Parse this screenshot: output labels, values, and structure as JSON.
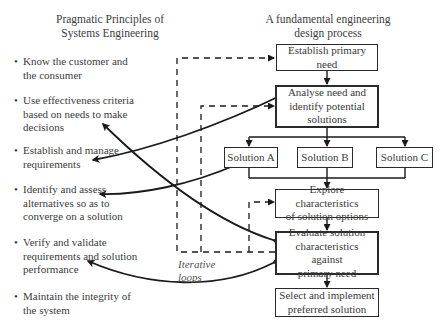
{
  "left_column": {
    "heading_line1": "Pragmatic Principles of",
    "heading_line2": "Systems Engineering",
    "principles": [
      {
        "line1": "Know the customer and",
        "line2": "the consumer",
        "line3": ""
      },
      {
        "line1": "Use effectiveness criteria",
        "line2": "based on needs to make",
        "line3": "decisions"
      },
      {
        "line1": "Establish and manage",
        "line2": "requirements",
        "line3": ""
      },
      {
        "line1": "Identify and assess",
        "line2": "alternatives so as to",
        "line3": "converge on a solution"
      },
      {
        "line1": "Verify and validate",
        "line2": "requirements and solution",
        "line3": "performance"
      },
      {
        "line1": "Maintain the integrity of",
        "line2": "the system",
        "line3": ""
      }
    ]
  },
  "right_column": {
    "heading_line1": "A fundamental engineering",
    "heading_line2": "design process",
    "steps": [
      {
        "id": "establish",
        "line1": "Establish primary",
        "line2": "need",
        "line3": ""
      },
      {
        "id": "analyse",
        "line1": "Analyse need and",
        "line2": "identify potential",
        "line3": "solutions"
      },
      {
        "id": "solution_a",
        "line1": "Solution A",
        "line2": "",
        "line3": ""
      },
      {
        "id": "solution_b",
        "line1": "Solution B",
        "line2": "",
        "line3": ""
      },
      {
        "id": "solution_c",
        "line1": "Solution C",
        "line2": "",
        "line3": ""
      },
      {
        "id": "explore",
        "line1": "Explore characteristics",
        "line2": "of solution options",
        "line3": ""
      },
      {
        "id": "evaluate",
        "line1": "Evaluate solution",
        "line2": "characteristics against",
        "line3": "primary need"
      },
      {
        "id": "select",
        "line1": "Select and implement",
        "line2": "preferred solution",
        "line3": ""
      }
    ]
  },
  "annotation": {
    "line1": "Iterative",
    "line2": "loops"
  },
  "colors": {
    "line": "#1a1a1a",
    "text": "#3a3a3a",
    "background": "#ffffff"
  }
}
